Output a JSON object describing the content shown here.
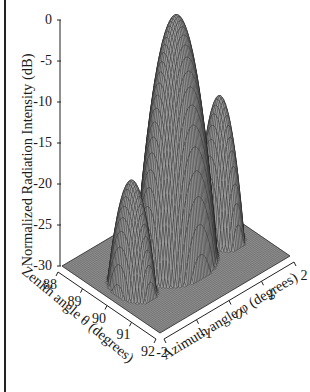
{
  "chart_data": {
    "type": "surface3d",
    "title": "",
    "zlabel": "Normalized Radiation Intensity (dB)",
    "xlabel": "Zenith angle θ (degrees)",
    "ylabel": "Azimuth angle φ (degrees)",
    "zlim": [
      -30,
      0
    ],
    "xlim": [
      88,
      92
    ],
    "ylim": [
      -2,
      2
    ],
    "z_ticks": [
      "0",
      "-5",
      "-10",
      "-15",
      "-20",
      "-25",
      "-30"
    ],
    "x_ticks": [
      "88",
      "89",
      "90",
      "91",
      "92"
    ],
    "y_ticks": [
      "-2",
      "-1",
      "0",
      "1",
      "2"
    ],
    "grid": false,
    "render_style": "mesh (dense black wireframe on grey)",
    "floor_db": -30,
    "lobes": [
      {
        "name": "main lobe",
        "theta_center": 90.0,
        "phi_center": 0.0,
        "peak_db": 0,
        "theta_halfwidth_deg": 1.05,
        "phi_halfwidth_deg": 1.0
      },
      {
        "name": "left sidelobe",
        "theta_center": 90.0,
        "phi_center": -1.35,
        "peak_db": -17,
        "theta_halfwidth_deg": 0.8,
        "phi_halfwidth_deg": 0.45
      },
      {
        "name": "right sidelobe",
        "theta_center": 90.0,
        "phi_center": 1.35,
        "peak_db": -13,
        "theta_halfwidth_deg": 0.8,
        "phi_halfwidth_deg": 0.45
      }
    ]
  },
  "colors": {
    "mesh_line": "#1a1a1a",
    "mesh_fill": "#9a9a9a",
    "floor": "#8c8c8c",
    "axis": "#222222"
  }
}
